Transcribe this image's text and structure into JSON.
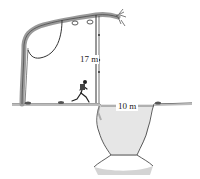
{
  "diagram": {
    "labels": {
      "vine_height": "17 m",
      "ravine_width": "10 m"
    },
    "elements": [
      "tree",
      "vine",
      "runner",
      "ground",
      "ravine"
    ],
    "colors": {
      "line": "#333333",
      "tree_fill": "#9a9a9a",
      "ravine_shade": "#c8c8c8",
      "ground": "#555555"
    }
  }
}
